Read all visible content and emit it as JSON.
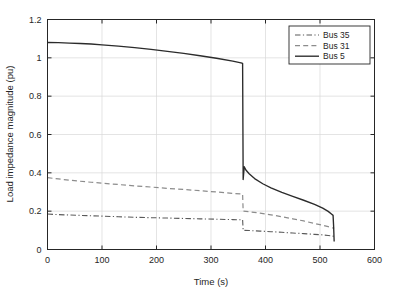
{
  "chart_data": {
    "type": "line",
    "title": "",
    "xlabel": "Time (s)",
    "ylabel": "Load impedance magnitude (pu)",
    "xlim": [
      0,
      600
    ],
    "ylim": [
      0,
      1.2
    ],
    "xticks": [
      0,
      100,
      200,
      300,
      400,
      500,
      600
    ],
    "yticks": [
      0,
      0.2,
      0.4,
      0.6,
      0.8,
      1,
      1.2
    ],
    "xticklabels": [
      "0",
      "100",
      "200",
      "300",
      "400",
      "500",
      "600"
    ],
    "yticklabels": [
      "0",
      "0.2",
      "0.4",
      "0.6",
      "0.8",
      "1",
      "1.2"
    ],
    "grid": true,
    "legend_position": "upper right",
    "series": [
      {
        "name": "Bus 35",
        "style": "dashdot",
        "color": "#5a5a5a",
        "width": 1.1,
        "points": [
          [
            0,
            0.185
          ],
          [
            20,
            0.182
          ],
          [
            40,
            0.18
          ],
          [
            60,
            0.178
          ],
          [
            80,
            0.176
          ],
          [
            100,
            0.174
          ],
          [
            130,
            0.171
          ],
          [
            160,
            0.168
          ],
          [
            190,
            0.166
          ],
          [
            220,
            0.164
          ],
          [
            250,
            0.162
          ],
          [
            280,
            0.16
          ],
          [
            310,
            0.158
          ],
          [
            340,
            0.156
          ],
          [
            358,
            0.155
          ],
          [
            359,
            0.1
          ],
          [
            370,
            0.099
          ],
          [
            390,
            0.096
          ],
          [
            410,
            0.093
          ],
          [
            430,
            0.09
          ],
          [
            450,
            0.086
          ],
          [
            470,
            0.083
          ],
          [
            490,
            0.079
          ],
          [
            505,
            0.076
          ],
          [
            515,
            0.073
          ],
          [
            523,
            0.07
          ],
          [
            526,
            0.069
          ]
        ]
      },
      {
        "name": "Bus 31",
        "style": "dashed",
        "color": "#8c8c8c",
        "width": 1.2,
        "points": [
          [
            0,
            0.375
          ],
          [
            20,
            0.368
          ],
          [
            40,
            0.362
          ],
          [
            60,
            0.356
          ],
          [
            80,
            0.351
          ],
          [
            100,
            0.346
          ],
          [
            130,
            0.339
          ],
          [
            160,
            0.332
          ],
          [
            190,
            0.326
          ],
          [
            220,
            0.319
          ],
          [
            250,
            0.313
          ],
          [
            280,
            0.307
          ],
          [
            310,
            0.3
          ],
          [
            340,
            0.293
          ],
          [
            358,
            0.289
          ],
          [
            359,
            0.2
          ],
          [
            370,
            0.197
          ],
          [
            390,
            0.19
          ],
          [
            410,
            0.181
          ],
          [
            430,
            0.171
          ],
          [
            450,
            0.16
          ],
          [
            470,
            0.149
          ],
          [
            490,
            0.136
          ],
          [
            505,
            0.126
          ],
          [
            515,
            0.119
          ],
          [
            523,
            0.113
          ],
          [
            526,
            0.111
          ]
        ]
      },
      {
        "name": "Bus 5",
        "style": "solid",
        "color": "#2b2b2b",
        "width": 1.35,
        "points": [
          [
            0,
            1.08
          ],
          [
            20,
            1.079
          ],
          [
            40,
            1.077
          ],
          [
            60,
            1.075
          ],
          [
            80,
            1.072
          ],
          [
            100,
            1.068
          ],
          [
            130,
            1.061
          ],
          [
            160,
            1.053
          ],
          [
            190,
            1.044
          ],
          [
            220,
            1.034
          ],
          [
            250,
            1.023
          ],
          [
            280,
            1.011
          ],
          [
            310,
            0.998
          ],
          [
            340,
            0.983
          ],
          [
            355,
            0.974
          ],
          [
            358,
            0.971
          ],
          [
            359,
            0.365
          ],
          [
            361,
            0.432
          ],
          [
            364,
            0.415
          ],
          [
            370,
            0.395
          ],
          [
            380,
            0.37
          ],
          [
            395,
            0.343
          ],
          [
            410,
            0.322
          ],
          [
            430,
            0.298
          ],
          [
            450,
            0.277
          ],
          [
            470,
            0.257
          ],
          [
            490,
            0.236
          ],
          [
            505,
            0.216
          ],
          [
            515,
            0.199
          ],
          [
            521,
            0.185
          ],
          [
            524,
            0.178
          ],
          [
            525,
            0.12
          ],
          [
            526,
            0.042
          ]
        ]
      }
    ]
  },
  "legend": {
    "entries": [
      {
        "label": "Bus 35"
      },
      {
        "label": "Bus 31"
      },
      {
        "label": "Bus 5"
      }
    ]
  },
  "colors": {
    "axis": "#262626",
    "grid": "#d9d9d9",
    "background": "#ffffff",
    "bus35": "#5a5a5a",
    "bus31": "#8c8c8c",
    "bus5": "#2b2b2b"
  }
}
